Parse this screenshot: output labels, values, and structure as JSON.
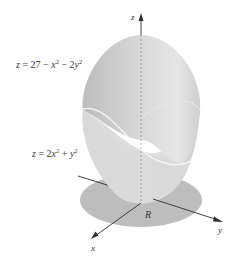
{
  "figure": {
    "upper_surface_label": {
      "z": "z",
      "eq": " = 27 − ",
      "x": "x",
      "x_exp": "2",
      "mid": " − 2",
      "y": "y",
      "y_exp": "2"
    },
    "lower_surface_label": {
      "z": "z",
      "eq": " = 2",
      "x": "x",
      "x_exp": "2",
      "mid": " + ",
      "y": "y",
      "y_exp": "2"
    },
    "axes": {
      "z": "z",
      "x": "x",
      "y": "y"
    },
    "region_label": "R",
    "colors": {
      "upper_surface": "#c9c9c9",
      "upper_surface_light": "#e2e2e2",
      "lower_surface": "#d8d8d8",
      "region": "#bdbdbd",
      "intersection_curve": "#f4f4f4",
      "axis": "#2f2f2f"
    }
  }
}
